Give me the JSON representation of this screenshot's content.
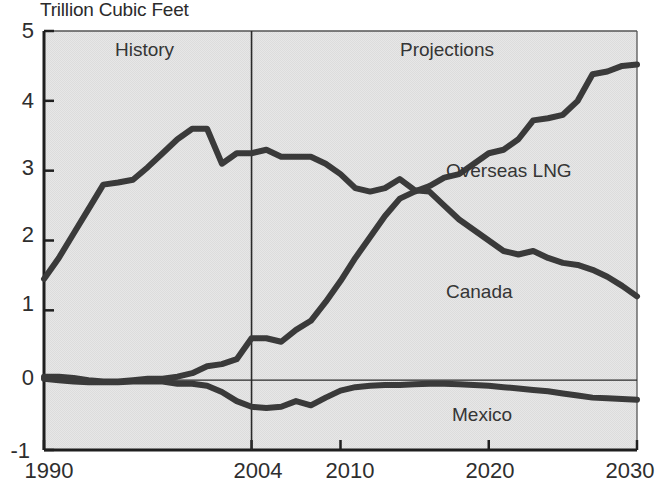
{
  "chart_data": {
    "type": "line",
    "title": "Trillion Cubic Feet",
    "xlabel": "",
    "ylabel": "Trillion Cubic Feet",
    "xlim": [
      1990,
      2030
    ],
    "ylim": [
      -1,
      5
    ],
    "yticks": [
      5,
      4,
      3,
      2,
      1,
      0,
      -1
    ],
    "ytick_labels": [
      "5",
      "4",
      "3",
      "2",
      "1",
      "0",
      "-1"
    ],
    "xticks": [
      1990,
      2004,
      2010,
      2020,
      2030
    ],
    "xtick_labels": [
      "1990",
      "2004",
      "2010",
      "2020",
      "2030"
    ],
    "grid": false,
    "legend_position": "inline-annotations",
    "annotations": [
      {
        "text": "History",
        "x": 1996,
        "y": 4.6
      },
      {
        "text": "Projections",
        "x": 2020,
        "y": 4.6
      },
      {
        "text": "Overseas LNG",
        "x": 2019,
        "y": 2.95
      },
      {
        "text": "Canada",
        "x": 2019,
        "y": 1.45
      },
      {
        "text": "Mexico",
        "x": 2020,
        "y": -0.62
      }
    ],
    "divider": {
      "x": 2004,
      "label": "history-projection-divider"
    },
    "zero_line": 0,
    "x": [
      1990,
      1991,
      1992,
      1993,
      1994,
      1995,
      1996,
      1997,
      1998,
      1999,
      2000,
      2001,
      2002,
      2003,
      2004,
      2005,
      2006,
      2007,
      2008,
      2009,
      2010,
      2011,
      2012,
      2013,
      2014,
      2015,
      2016,
      2017,
      2018,
      2019,
      2020,
      2021,
      2022,
      2023,
      2024,
      2025,
      2026,
      2027,
      2028,
      2029,
      2030
    ],
    "series": [
      {
        "name": "Canada",
        "values": [
          1.45,
          1.75,
          2.1,
          2.45,
          2.8,
          2.83,
          2.87,
          3.05,
          3.25,
          3.45,
          3.6,
          3.6,
          3.1,
          3.25,
          3.25,
          3.3,
          3.2,
          3.2,
          3.2,
          3.1,
          2.95,
          2.75,
          2.7,
          2.75,
          2.88,
          2.72,
          2.7,
          2.5,
          2.3,
          2.15,
          2.0,
          1.85,
          1.8,
          1.85,
          1.75,
          1.68,
          1.65,
          1.58,
          1.48,
          1.35,
          1.2
        ]
      },
      {
        "name": "Overseas LNG",
        "values": [
          0.05,
          0.05,
          0.03,
          0.0,
          -0.02,
          -0.02,
          0.0,
          0.02,
          0.02,
          0.05,
          0.1,
          0.2,
          0.23,
          0.3,
          0.6,
          0.6,
          0.55,
          0.72,
          0.85,
          1.12,
          1.42,
          1.75,
          2.05,
          2.35,
          2.6,
          2.7,
          2.78,
          2.9,
          2.95,
          3.1,
          3.25,
          3.3,
          3.45,
          3.72,
          3.75,
          3.8,
          4.0,
          4.38,
          4.42,
          4.5,
          4.52
        ]
      },
      {
        "name": "Mexico",
        "values": [
          0.02,
          0.0,
          -0.02,
          -0.03,
          -0.03,
          -0.03,
          -0.02,
          -0.02,
          -0.02,
          -0.05,
          -0.05,
          -0.08,
          -0.17,
          -0.3,
          -0.38,
          -0.4,
          -0.38,
          -0.3,
          -0.36,
          -0.25,
          -0.15,
          -0.1,
          -0.08,
          -0.07,
          -0.07,
          -0.06,
          -0.05,
          -0.05,
          -0.06,
          -0.07,
          -0.08,
          -0.1,
          -0.12,
          -0.14,
          -0.16,
          -0.19,
          -0.22,
          -0.25,
          -0.26,
          -0.27,
          -0.28
        ]
      }
    ],
    "colors": {
      "line": "#3a3a3a",
      "plot_background": "#e4e4e4",
      "axis": "#1f1f1f",
      "text": "#2e2e2e"
    }
  }
}
